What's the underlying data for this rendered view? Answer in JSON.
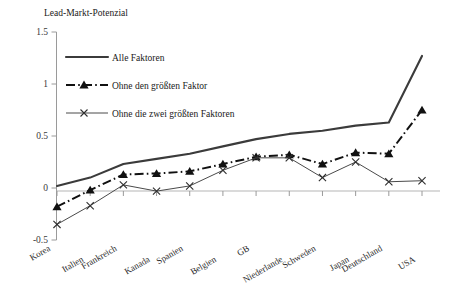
{
  "chart_data": {
    "type": "line",
    "title": "Lead-Markt-Potenzial",
    "xlabel": "",
    "ylabel": "",
    "ylim": [
      -0.5,
      1.5
    ],
    "yticks": [
      1.5,
      1,
      0.5,
      0,
      -0.5
    ],
    "ytick_labels": [
      "1.5",
      "1",
      "0.5",
      "0",
      "-0.5"
    ],
    "grid": false,
    "legend_position": "upper-left-inside",
    "categories": [
      "Korea",
      "Italien",
      "Frankreich",
      "Kanada",
      "Spanien",
      "Belgien",
      "GB",
      "Niederlande",
      "Schweden",
      "Japan",
      "Deutschland",
      "USA"
    ],
    "series": [
      {
        "name": "Alle Faktoren",
        "style": "solid",
        "marker": "none",
        "color": "#3b3b3b",
        "values": [
          0.02,
          0.1,
          0.23,
          0.28,
          0.33,
          0.4,
          0.47,
          0.52,
          0.55,
          0.6,
          0.63,
          1.27
        ]
      },
      {
        "name": "Ohne den größten Faktor",
        "style": "dash-dot",
        "marker": "triangle",
        "color": "#111111",
        "values": [
          -0.18,
          -0.02,
          0.13,
          0.14,
          0.16,
          0.23,
          0.3,
          0.32,
          0.23,
          0.34,
          0.33,
          0.75
        ]
      },
      {
        "name": "Ohne die zwei größten Faktoren",
        "style": "solid-thin",
        "marker": "x",
        "color": "#4a4a4a",
        "values": [
          -0.35,
          -0.17,
          0.03,
          -0.03,
          0.02,
          0.17,
          0.29,
          0.29,
          0.1,
          0.25,
          0.06,
          0.07
        ]
      }
    ]
  },
  "legend": {
    "items": [
      {
        "label": "Alle Faktoren"
      },
      {
        "label": "Ohne den größten Faktor"
      },
      {
        "label": "Ohne die zwei größten Faktoren"
      }
    ]
  },
  "axes": {
    "y_labels": [
      "1.5",
      "1",
      "0.5",
      "0",
      "-0.5"
    ],
    "x_labels": [
      "Korea",
      "Italien",
      "Frankreich",
      "Kanada",
      "Spanien",
      "Belgien",
      "GB",
      "Niederlande",
      "Schweden",
      "Japan",
      "Deutschland",
      "USA"
    ]
  },
  "header": {
    "title": "Lead-Markt-Potenzial"
  }
}
